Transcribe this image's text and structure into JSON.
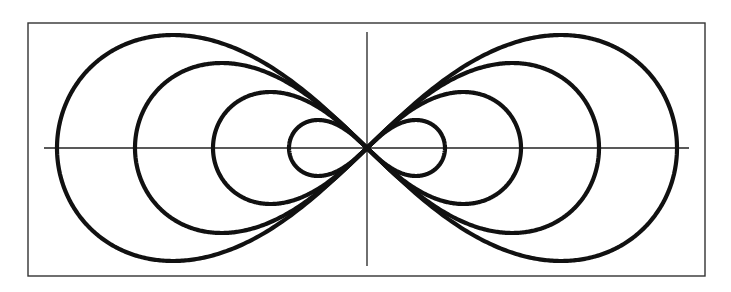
{
  "chart_data": {
    "type": "line",
    "title": "",
    "xlabel": "",
    "ylabel": "",
    "grid": false,
    "legend": null,
    "frame": {
      "x": 28,
      "y": 23,
      "width": 677,
      "height": 253
    },
    "origin": {
      "x": 367,
      "y": 148
    },
    "x_axis": {
      "x1": 44,
      "x2": 689,
      "y": 148
    },
    "y_axis": {
      "x": 367,
      "y1": 32,
      "y2": 266
    },
    "tangent_angle_deg": 41,
    "series": [
      {
        "name": "curve-1",
        "half_width": 78,
        "half_height": 28
      },
      {
        "name": "curve-2",
        "half_width": 154,
        "half_height": 56
      },
      {
        "name": "curve-3",
        "half_width": 232,
        "half_height": 85
      },
      {
        "name": "curve-4",
        "half_width": 310,
        "half_height": 113
      }
    ]
  },
  "colors": {
    "curve": "#111111",
    "axis": "#222222",
    "frame": "#333333",
    "background": "#ffffff"
  }
}
